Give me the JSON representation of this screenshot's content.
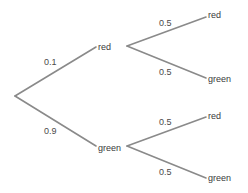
{
  "diagram": {
    "type": "probability-tree",
    "root": {
      "branches": [
        {
          "probability": "0.1",
          "outcome": "red",
          "branches": [
            {
              "probability": "0.5",
              "outcome": "red"
            },
            {
              "probability": "0.5",
              "outcome": "green"
            }
          ]
        },
        {
          "probability": "0.9",
          "outcome": "green",
          "branches": [
            {
              "probability": "0.5",
              "outcome": "red"
            },
            {
              "probability": "0.5",
              "outcome": "green"
            }
          ]
        }
      ]
    }
  }
}
